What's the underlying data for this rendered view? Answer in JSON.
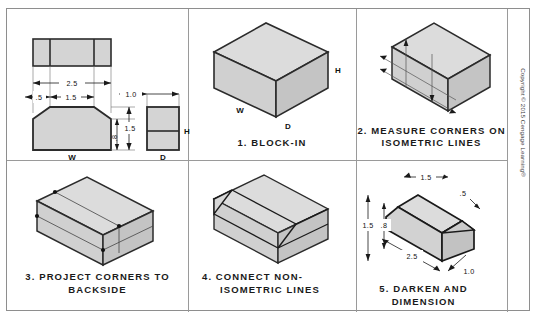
{
  "figure": {
    "copyright": "Copyright © 2015 Cengage Learning®",
    "colors": {
      "face_light": "#dcdcdc",
      "face_mid": "#d0d0d0",
      "face_dark": "#c4c4c4",
      "outline": "#2b2b2b",
      "construction": "#6e6e6e",
      "divider": "#9a9a9a",
      "text": "#1a1a1a"
    }
  },
  "panels": [
    {
      "id": "orthographic-views",
      "caption": "",
      "view_labels": {
        "width": "W",
        "depth": "D",
        "height": "H"
      },
      "dimensions": {
        "overall_width": "2.5",
        "chamfer_left": ".5",
        "flat_top": "1.5",
        "depth": "1.0",
        "height_upper": "1.5",
        "height_lower": ".8"
      }
    },
    {
      "id": "block-in",
      "caption": "1. BLOCK-IN",
      "view_labels": {
        "width": "W",
        "depth": "D",
        "height": "H"
      }
    },
    {
      "id": "measure-corners",
      "caption_line1": "2. MEASURE CORNERS ON",
      "caption_line2": "ISOMETRIC LINES"
    },
    {
      "id": "project-corners",
      "caption_line1": "3. PROJECT CORNERS TO",
      "caption_line2": "BACKSIDE"
    },
    {
      "id": "connect-nonisometric",
      "caption_line1": "4. CONNECT NON-",
      "caption_line2": "ISOMETRIC LINES"
    },
    {
      "id": "darken-dimension",
      "caption": "5. DARKEN AND DIMENSION",
      "dimensions": {
        "top_flat": "1.5",
        "chamfer": ".5",
        "height_total": "1.5",
        "height_lower": ".8",
        "length": "2.5",
        "depth": "1.0"
      }
    }
  ]
}
